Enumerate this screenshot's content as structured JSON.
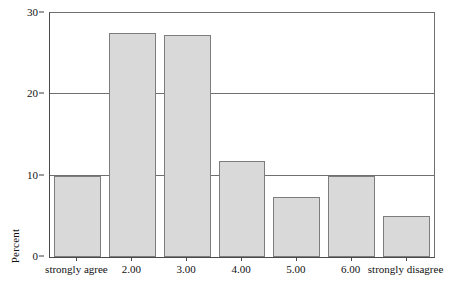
{
  "chart_data": {
    "type": "bar",
    "title": "",
    "subtitle": "",
    "xlabel": "",
    "ylabel": "Percent",
    "categories": [
      "strongly agree",
      "2.00",
      "3.00",
      "4.00",
      "5.00",
      "6.00",
      "strongly disagree"
    ],
    "values": [
      10.0,
      27.5,
      27.3,
      11.8,
      7.4,
      10.0,
      5.0
    ],
    "ylim": [
      0,
      30
    ],
    "yticks": [
      0,
      10,
      20,
      30
    ],
    "ytick_labels": [
      "0",
      "10",
      "20",
      "30"
    ],
    "grid": true,
    "grid_axis": "y",
    "legend": false,
    "legend_position": "none",
    "bar_fill_color": "#d9d9d9",
    "bar_border_color": "#7d7d7d",
    "axis_color": "#4a4a4a",
    "grid_color": "#6f6f6f",
    "background_color": "#ffffff"
  }
}
